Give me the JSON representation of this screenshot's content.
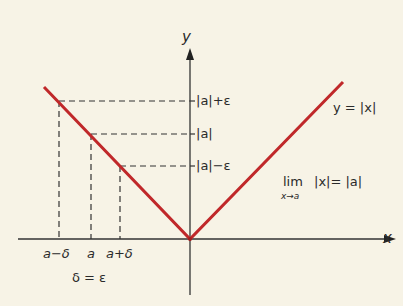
{
  "diagram": {
    "axes": {
      "x_label": "x",
      "y_label": "y"
    },
    "curve_label": "y = |x|",
    "curve_color": "#c0282a",
    "y_ticks": [
      "|a|+ε",
      "|a|",
      "|a|−ε"
    ],
    "x_ticks": [
      "a−δ",
      "a",
      "a+δ"
    ],
    "delta_relation": "δ = ε",
    "limit": {
      "lim": "lim",
      "sub": "x→a",
      "expr": "|x|= |a|"
    }
  }
}
